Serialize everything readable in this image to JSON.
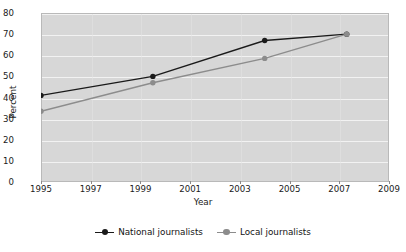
{
  "chart_data": {
    "type": "line",
    "title": "",
    "xlabel": "Year",
    "ylabel": "Percent",
    "xlim": [
      1995,
      2009
    ],
    "ylim": [
      0,
      80
    ],
    "xticks": [
      1995,
      1997,
      1999,
      2001,
      2003,
      2005,
      2007,
      2009
    ],
    "yticks": [
      0,
      10,
      20,
      30,
      40,
      50,
      60,
      70,
      80
    ],
    "grid": "horizontal",
    "legend_position": "bottom",
    "series": [
      {
        "name": "National journalists",
        "color": "#1a1a1a",
        "x": [
          1995,
          1999.5,
          2004,
          2007.3
        ],
        "values": [
          41,
          50,
          67,
          70
        ]
      },
      {
        "name": "Local journalists",
        "color": "#8c8c8c",
        "x": [
          1995,
          1999.5,
          2004,
          2007.3
        ],
        "values": [
          33.5,
          47,
          58.5,
          70
        ]
      }
    ]
  },
  "legend": {
    "entries": [
      {
        "label": "National journalists",
        "marker": "line-dot-marker-black"
      },
      {
        "label": "Local journalists",
        "marker": "line-dot-marker-gray"
      }
    ]
  },
  "axes": {
    "x_title": "Year",
    "y_title": "Percent",
    "x_tick_labels": [
      "1995",
      "1997",
      "1999",
      "2001",
      "2003",
      "2005",
      "2007",
      "2009"
    ],
    "y_tick_labels": [
      "0",
      "10",
      "20",
      "30",
      "40",
      "50",
      "60",
      "70",
      "80"
    ]
  },
  "colors": {
    "plot_background": "#d7d7d7",
    "gridline": "#f2f2f2",
    "series_primary": "#1a1a1a",
    "series_secondary": "#8c8c8c",
    "text": "#1a1a1a"
  }
}
